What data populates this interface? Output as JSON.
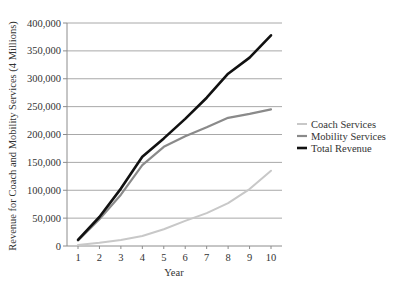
{
  "chart_data": {
    "type": "line",
    "title": "",
    "xlabel": "Year",
    "ylabel": "Revenue for Coach and Mobility Services (4 Millions)",
    "x": [
      1,
      2,
      3,
      4,
      5,
      6,
      7,
      8,
      9,
      10
    ],
    "ylim": [
      0,
      400000
    ],
    "yticks": [
      0,
      50000,
      100000,
      150000,
      200000,
      250000,
      300000,
      350000,
      400000
    ],
    "ytick_labels": [
      "0",
      "50,000",
      "100,000",
      "150,000",
      "200,000",
      "250,000",
      "300,000",
      "350,000",
      "400,000"
    ],
    "xtick_labels": [
      "1",
      "2",
      "3",
      "4",
      "5",
      "6",
      "7",
      "8",
      "9",
      "10"
    ],
    "grid": true,
    "legend_position": "right",
    "series": [
      {
        "name": "Coach Services",
        "color": "#c8c8c8",
        "width": 2,
        "values": [
          2000,
          6000,
          11000,
          18000,
          30000,
          45000,
          59000,
          77000,
          102000,
          135000
        ]
      },
      {
        "name": "Mobility Services",
        "color": "#8a8a8a",
        "width": 2.2,
        "values": [
          10000,
          48000,
          92000,
          145000,
          178000,
          197000,
          213000,
          230000,
          237000,
          245000
        ]
      },
      {
        "name": "Total Revenue",
        "color": "#111111",
        "width": 2.6,
        "values": [
          11000,
          52000,
          103000,
          160000,
          193000,
          228000,
          266000,
          309000,
          338000,
          378000
        ]
      }
    ]
  }
}
